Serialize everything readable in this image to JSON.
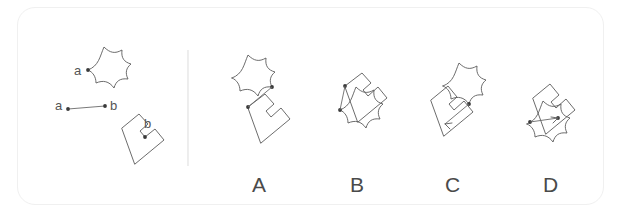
{
  "card": {
    "border_color": "#f0f0f0",
    "background": "#ffffff"
  },
  "question": {
    "type": "mental-rotation-spatial-reasoning",
    "prompt_panel": {
      "shapes": [
        {
          "name": "star-blob",
          "label": "a",
          "label_position": "left-vertex"
        },
        {
          "name": "notched-square",
          "label": "b",
          "label_position": "inner-corner"
        }
      ],
      "vector": {
        "from_label": "a",
        "to_label": "b",
        "direction": "horizontal-right"
      }
    },
    "divider": {
      "orientation": "vertical",
      "color": "#e2e2e2"
    }
  },
  "labels": {
    "a_on_blob": "a",
    "a_on_vector": "a",
    "b_on_vector": "b",
    "b_on_square": "b"
  },
  "options": [
    {
      "id": "A",
      "label": "A",
      "blob_position": "top-left",
      "square_position": "bottom-right",
      "connector": "down-left"
    },
    {
      "id": "B",
      "label": "B",
      "blob_position": "bottom-left",
      "square_position": "top-right",
      "connector": "down-left"
    },
    {
      "id": "C",
      "label": "C",
      "blob_position": "top-right",
      "square_position": "bottom-left",
      "connector": "down-left-arrow"
    },
    {
      "id": "D",
      "label": "D",
      "blob_position": "bottom-left",
      "square_position": "top-right",
      "connector": "up-right-arrow"
    }
  ],
  "colors": {
    "stroke": "#5b5b5b",
    "dot": "#3a3a3a",
    "label_text": "#4a4a4a",
    "small_label_text": "#555555",
    "divider": "#e2e2e2",
    "card_border": "#f0f0f0"
  }
}
